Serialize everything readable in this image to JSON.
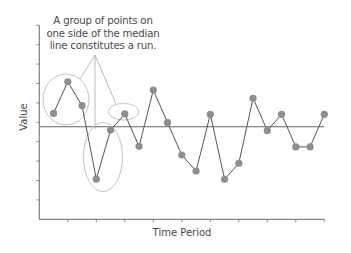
{
  "chart_data": {
    "type": "line",
    "title": "",
    "xlabel": "Time Period",
    "ylabel": "Value",
    "x": [
      1,
      2,
      3,
      4,
      5,
      6,
      7,
      8,
      9,
      10,
      11,
      12,
      13,
      14,
      15,
      16,
      17,
      18,
      19,
      20
    ],
    "series": [
      {
        "name": "Values",
        "values": [
          5.46,
          7.09,
          5.86,
          2.07,
          4.6,
          5.43,
          3.76,
          6.66,
          4.98,
          3.31,
          2.49,
          5.41,
          2.06,
          2.89,
          6.24,
          4.57,
          5.41,
          3.73,
          3.73,
          5.41
        ]
      }
    ],
    "median": 4.77,
    "ylim": [
      0,
      10
    ],
    "xlim": [
      0,
      20
    ],
    "y_ticks_count": 10,
    "x_ticks": [
      2,
      4,
      6,
      8,
      10,
      12,
      14,
      16,
      18,
      20
    ],
    "tick_labels_shown": false,
    "grid": false,
    "legend": null,
    "annotations": {
      "text_lines": [
        "A group of points on",
        "one side of the median",
        "line constitutes a run."
      ],
      "highlighted_runs": [
        {
          "points": [
            1,
            2,
            3
          ],
          "side": "above"
        },
        {
          "points": [
            4,
            5
          ],
          "side": "below"
        },
        {
          "points": [
            6
          ],
          "side": "above"
        }
      ]
    }
  },
  "colors": {
    "axis": "#6a6a6a",
    "line": "#555555",
    "point": "#8e8e8e",
    "median": "#666666",
    "ellipse": "#bdbdbd",
    "pointer": "#a8a8a8",
    "text": "#4a4a4a"
  }
}
